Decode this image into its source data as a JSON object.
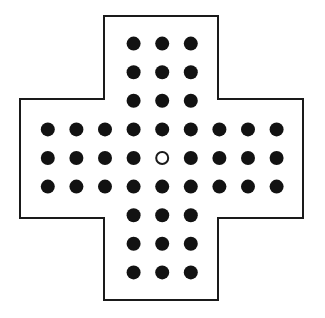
{
  "figure": {
    "background_color": "#ffffff"
  },
  "board": {
    "shape_name": "greek-cross",
    "grid_columns": 9,
    "grid_rows": 9,
    "total_holes": 33,
    "pegs_filled": 32,
    "holes_empty": 1,
    "empty_hole_label": "centre",
    "outline_color": "#1a1a1a",
    "outline_width": 2,
    "fill_color": "#ffffff",
    "peg_color": "#121212",
    "hole_stroke_color": "#1a1a1a",
    "peg_diameter": 14,
    "hole_diameter": 14,
    "hole_stroke_width": 2,
    "cell_pitch": 28.6,
    "origin_x": 47.8,
    "origin_y": 43.6,
    "outline_points": "104,16 218,16 218,99 303,99 303,218 218,218 218,300 104,300 104,218 20,218 20,99 104,99",
    "cells": [
      {
        "row": 0,
        "col": 3,
        "state": "peg"
      },
      {
        "row": 0,
        "col": 4,
        "state": "peg"
      },
      {
        "row": 0,
        "col": 5,
        "state": "peg"
      },
      {
        "row": 1,
        "col": 3,
        "state": "peg"
      },
      {
        "row": 1,
        "col": 4,
        "state": "peg"
      },
      {
        "row": 1,
        "col": 5,
        "state": "peg"
      },
      {
        "row": 2,
        "col": 3,
        "state": "peg"
      },
      {
        "row": 2,
        "col": 4,
        "state": "peg"
      },
      {
        "row": 2,
        "col": 5,
        "state": "peg"
      },
      {
        "row": 3,
        "col": 0,
        "state": "peg"
      },
      {
        "row": 3,
        "col": 1,
        "state": "peg"
      },
      {
        "row": 3,
        "col": 2,
        "state": "peg"
      },
      {
        "row": 3,
        "col": 3,
        "state": "peg"
      },
      {
        "row": 3,
        "col": 4,
        "state": "peg"
      },
      {
        "row": 3,
        "col": 5,
        "state": "peg"
      },
      {
        "row": 3,
        "col": 6,
        "state": "peg"
      },
      {
        "row": 3,
        "col": 7,
        "state": "peg"
      },
      {
        "row": 3,
        "col": 8,
        "state": "peg"
      },
      {
        "row": 4,
        "col": 0,
        "state": "peg"
      },
      {
        "row": 4,
        "col": 1,
        "state": "peg"
      },
      {
        "row": 4,
        "col": 2,
        "state": "peg"
      },
      {
        "row": 4,
        "col": 3,
        "state": "peg"
      },
      {
        "row": 4,
        "col": 4,
        "state": "empty"
      },
      {
        "row": 4,
        "col": 5,
        "state": "peg"
      },
      {
        "row": 4,
        "col": 6,
        "state": "peg"
      },
      {
        "row": 4,
        "col": 7,
        "state": "peg"
      },
      {
        "row": 4,
        "col": 8,
        "state": "peg"
      },
      {
        "row": 5,
        "col": 0,
        "state": "peg"
      },
      {
        "row": 5,
        "col": 1,
        "state": "peg"
      },
      {
        "row": 5,
        "col": 2,
        "state": "peg"
      },
      {
        "row": 5,
        "col": 3,
        "state": "peg"
      },
      {
        "row": 5,
        "col": 4,
        "state": "peg"
      },
      {
        "row": 5,
        "col": 5,
        "state": "peg"
      },
      {
        "row": 5,
        "col": 6,
        "state": "peg"
      },
      {
        "row": 5,
        "col": 7,
        "state": "peg"
      },
      {
        "row": 5,
        "col": 8,
        "state": "peg"
      },
      {
        "row": 6,
        "col": 3,
        "state": "peg"
      },
      {
        "row": 6,
        "col": 4,
        "state": "peg"
      },
      {
        "row": 6,
        "col": 5,
        "state": "peg"
      },
      {
        "row": 7,
        "col": 3,
        "state": "peg"
      },
      {
        "row": 7,
        "col": 4,
        "state": "peg"
      },
      {
        "row": 7,
        "col": 5,
        "state": "peg"
      },
      {
        "row": 8,
        "col": 3,
        "state": "peg"
      },
      {
        "row": 8,
        "col": 4,
        "state": "peg"
      },
      {
        "row": 8,
        "col": 5,
        "state": "peg"
      }
    ]
  }
}
